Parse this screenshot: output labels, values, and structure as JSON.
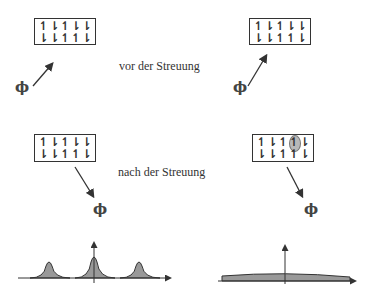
{
  "labels": {
    "before": "vor der Streuung",
    "after": "nach der Streuung"
  },
  "phi_symbol": "ϕ",
  "spin_glyphs": {
    "up": "↿",
    "down": "⇂"
  },
  "panels": {
    "top_left": {
      "rows": [
        [
          "up",
          "down",
          "up",
          "down",
          "down"
        ],
        [
          "down",
          "down",
          "up",
          "up",
          "down"
        ]
      ],
      "highlight": null
    },
    "top_right": {
      "rows": [
        [
          "up",
          "down",
          "up",
          "down",
          "down"
        ],
        [
          "down",
          "down",
          "up",
          "up",
          "down"
        ]
      ],
      "highlight": null
    },
    "bottom_left": {
      "rows": [
        [
          "up",
          "down",
          "up",
          "down",
          "down"
        ],
        [
          "down",
          "down",
          "up",
          "up",
          "down"
        ]
      ],
      "highlight": null
    },
    "bottom_right": {
      "rows": [
        [
          "up",
          "down",
          "up",
          "up",
          "down"
        ],
        [
          "down",
          "down",
          "up",
          "up",
          "down"
        ]
      ],
      "highlight": [
        0,
        3
      ]
    }
  },
  "plots": {
    "left": {
      "type": "line",
      "description": "three sharp Bragg peaks (elastic scattering)",
      "peaks_x": [
        -1,
        0,
        1
      ],
      "fill": "#999999"
    },
    "right": {
      "type": "area",
      "description": "broad flat distribution (spin-flip, diffuse scattering)",
      "fill": "#999999"
    }
  },
  "colors": {
    "line": "#333333",
    "fill": "#999999",
    "highlight": "#b8b8b8"
  }
}
